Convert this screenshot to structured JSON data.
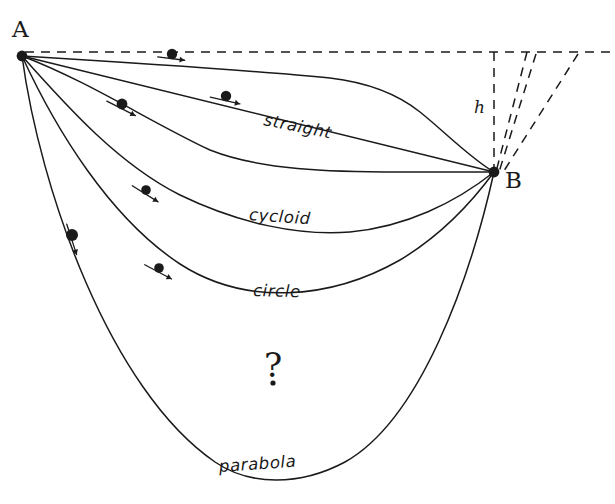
{
  "figure": {
    "background_color": "#ffffff",
    "ink_color": "#1a1a1a",
    "width": 615,
    "height": 504
  },
  "points": {
    "start": {
      "label": "A",
      "x": 22,
      "y": 56,
      "label_x": 12,
      "label_y": 18
    },
    "end": {
      "label": "B",
      "x": 494,
      "y": 172,
      "label_x": 505,
      "label_y": 169
    },
    "unknown_marker": {
      "label": "?",
      "x": 264,
      "y": 348,
      "dot_x": 273,
      "dot_y": 383
    }
  },
  "height_label": {
    "text": "h",
    "x": 474,
    "y": 99
  },
  "curves": [
    {
      "name": "top-unlabeled-path",
      "label": "",
      "label_x": null,
      "label_y": null,
      "path": "M22,56 C120,62 250,70 330,78 C372,83 400,96 420,112 C445,132 470,158 494,172",
      "stroke_width": 1.5
    },
    {
      "name": "straight",
      "label": "straight",
      "label_x": 264,
      "label_y": 112,
      "path": "M22,56 L494,172",
      "stroke_width": 1.5
    },
    {
      "name": "second-unlabeled-path",
      "label": "",
      "label_x": null,
      "label_y": null,
      "path": "M22,56 C90,82 150,122 210,150 C260,170 330,172 400,172 C432,172 466,172 494,172",
      "stroke_width": 1.4
    },
    {
      "name": "cycloid",
      "label": "cycloid",
      "label_x": 249,
      "label_y": 207,
      "path": "M22,56 C70,110 120,165 180,195 C240,224 300,236 350,232 C405,227 455,203 494,172",
      "stroke_width": 1.5
    },
    {
      "name": "circle",
      "label": "circle",
      "label_x": 253,
      "label_y": 283,
      "path": "M22,56 C56,130 110,218 180,264 C245,306 330,300 400,260 C440,236 472,202 494,172",
      "stroke_width": 1.5
    },
    {
      "name": "parabola",
      "label": "parabola",
      "label_x": 219,
      "label_y": 459,
      "path": "M22,56 C40,190 110,390 215,462 C250,486 300,486 345,462 C420,420 470,280 494,172",
      "stroke_width": 1.5
    }
  ],
  "beads": [
    {
      "on_curve": "top-unlabeled-path",
      "x": 172,
      "y": 54,
      "r": 5.2,
      "arrow_angle_deg": 7,
      "arrow_len": 17
    },
    {
      "on_curve": "straight",
      "x": 226,
      "y": 96,
      "r": 5.2,
      "arrow_angle_deg": 13,
      "arrow_len": 19
    },
    {
      "on_curve": "second-unlabeled-path",
      "x": 122,
      "y": 104,
      "r": 5.4,
      "arrow_angle_deg": 27,
      "arrow_len": 20
    },
    {
      "on_curve": "cycloid",
      "x": 146,
      "y": 190,
      "r": 4.8,
      "arrow_angle_deg": 32,
      "arrow_len": 19
    },
    {
      "on_curve": "circle",
      "x": 159,
      "y": 268,
      "r": 4.8,
      "arrow_angle_deg": 28,
      "arrow_len": 19
    },
    {
      "on_curve": "parabola",
      "x": 72,
      "y": 235,
      "r": 6.0,
      "arrow_angle_deg": 72,
      "arrow_len": 20
    }
  ],
  "dashed_lines": [
    {
      "name": "horizontal-datum",
      "x1": 25,
      "y1": 52,
      "x2": 612,
      "y2": 52
    },
    {
      "name": "vertical-drop-h",
      "x1": 494,
      "y1": 52,
      "x2": 494,
      "y2": 172
    },
    {
      "name": "incline-1",
      "x1": 527,
      "y1": 52,
      "x2": 496,
      "y2": 172
    },
    {
      "name": "incline-2",
      "x1": 536,
      "y1": 54,
      "x2": 499,
      "y2": 172
    },
    {
      "name": "incline-3",
      "x1": 578,
      "y1": 54,
      "x2": 502,
      "y2": 174
    }
  ]
}
